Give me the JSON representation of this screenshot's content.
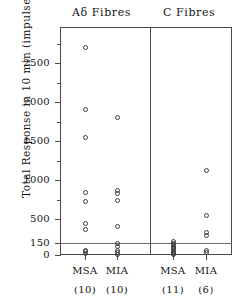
{
  "chart_data": {
    "type": "scatter",
    "title": "",
    "xlabel": "",
    "ylabel": "Total Response in 10 min (impulses)",
    "panel_titles": [
      "Aδ Fibres",
      "C Fibres"
    ],
    "ylim": [
      0,
      2800
    ],
    "ytick_labels": [
      "0",
      "150",
      "500",
      "1000",
      "1500",
      "2000",
      "2500"
    ],
    "ytick_values": [
      0,
      150,
      500,
      1000,
      1500,
      2000,
      2500
    ],
    "grid": "horizontal reference line at 150",
    "reference_line": 150,
    "legend": "none",
    "groups": [
      {
        "panel": "Aδ Fibres",
        "label": "MSA",
        "n_label": "(10)",
        "n": 10,
        "values": [
          2700,
          1900,
          1540,
          840,
          720,
          430,
          350,
          60,
          40,
          20
        ]
      },
      {
        "panel": "Aδ Fibres",
        "label": "MIA",
        "n_label": "(10)",
        "n": 10,
        "values": [
          1800,
          860,
          830,
          740,
          390,
          150,
          110,
          60,
          30,
          10
        ]
      },
      {
        "panel": "C Fibres",
        "label": "MSA",
        "n_label": "(11)",
        "n": 11,
        "values": [
          175,
          150,
          130,
          110,
          95,
          80,
          65,
          50,
          35,
          20,
          10
        ]
      },
      {
        "panel": "C Fibres",
        "label": "MIA",
        "n_label": "(6)",
        "n": 6,
        "values": [
          1120,
          540,
          300,
          260,
          60,
          30
        ]
      }
    ]
  },
  "axes": {
    "y_ticks": [
      {
        "label": "2500",
        "value": 2500
      },
      {
        "label": "2000",
        "value": 2000
      },
      {
        "label": "1500",
        "value": 1500
      },
      {
        "label": "1000",
        "value": 1000
      },
      {
        "label": "500",
        "value": 500
      },
      {
        "label": "150",
        "value": 150
      },
      {
        "label": "0",
        "value": 0
      }
    ]
  },
  "colors": {
    "marker_stroke": "#3c3c3c",
    "axis": "#4a4a4a",
    "gridline": "#6a6a6a",
    "text": "#141414",
    "background": "#ffffff"
  }
}
